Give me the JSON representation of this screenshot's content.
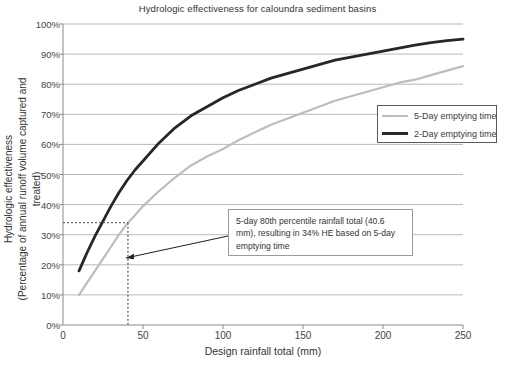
{
  "chart_data": {
    "type": "line",
    "title": "Hydrologic effectiveness for caloundra sediment basins",
    "xlabel": "Design rainfall total (mm)",
    "ylabel_line1": "Hydrologic effectiveness",
    "ylabel_line2": "(Percentage of annual runoff volume captured and treated)",
    "xlim": [
      0,
      250
    ],
    "ylim": [
      0,
      100
    ],
    "xticks": [
      0,
      50,
      100,
      150,
      200,
      250
    ],
    "xtick_labels": [
      "0",
      "50",
      "100",
      "150",
      "200",
      "250"
    ],
    "yticks": [
      0,
      10,
      20,
      30,
      40,
      50,
      60,
      70,
      80,
      90,
      100
    ],
    "ytick_labels": [
      "0%",
      "10%",
      "20%",
      "30%",
      "40%",
      "50%",
      "60%",
      "70%",
      "80%",
      "90%",
      "100%"
    ],
    "grid": "horizontal",
    "legend_position": "center-right",
    "series": [
      {
        "name": "5-Day emptying time",
        "color": "#bdbdbd",
        "x": [
          10,
          15,
          20,
          25,
          30,
          35,
          40.6,
          45,
          50,
          60,
          70,
          80,
          90,
          100,
          110,
          120,
          130,
          140,
          150,
          160,
          170,
          180,
          190,
          200,
          210,
          220,
          230,
          240,
          250
        ],
        "y": [
          10,
          14,
          18,
          22,
          26,
          30,
          34,
          36.5,
          39.5,
          44.5,
          49,
          53,
          56,
          58.5,
          61.5,
          64,
          66.5,
          68.5,
          70.5,
          72.5,
          74.5,
          76,
          77.5,
          79,
          80.5,
          81.5,
          83,
          84.5,
          86
        ]
      },
      {
        "name": "2-Day emptying time",
        "color": "#272727",
        "x": [
          10,
          15,
          20,
          25,
          30,
          35,
          40,
          45,
          50,
          60,
          70,
          80,
          90,
          100,
          110,
          120,
          130,
          140,
          150,
          160,
          170,
          180,
          190,
          200,
          210,
          220,
          230,
          240,
          250
        ],
        "y": [
          18,
          24,
          29.5,
          34.5,
          39.5,
          44,
          48,
          51.5,
          54.5,
          60.5,
          65.5,
          69.5,
          72.5,
          75.5,
          78,
          80,
          82,
          83.5,
          85,
          86.5,
          88,
          89,
          90,
          91,
          92,
          93,
          93.8,
          94.5,
          95
        ]
      }
    ],
    "annotations": [
      {
        "name": "callout",
        "line1": "5-day 80th percentile rainfall total (40.6 mm),",
        "line2": "resulting in 34% HE based on 5-day",
        "line3": "emptying time",
        "marker_x": 40.6,
        "marker_y": 34
      }
    ]
  },
  "legend": {
    "items": [
      {
        "label": "5-Day emptying time"
      },
      {
        "label": "2-Day emptying time"
      }
    ]
  }
}
